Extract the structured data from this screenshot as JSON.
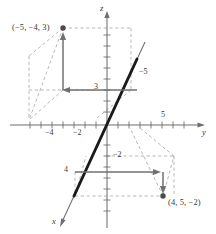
{
  "figure": {
    "axes": {
      "z_label": "z",
      "y_label": "y",
      "x_label": "x"
    },
    "points": [
      {
        "id": "p1",
        "label": "(−5, −4, 3)",
        "x": -5,
        "y": -4,
        "z": 3
      },
      {
        "id": "p2",
        "label": "(4, 5, −2)",
        "x": 4,
        "y": 5,
        "z": -2
      }
    ],
    "tick_labels": {
      "y_neg4": "−4",
      "y_neg2": "−2",
      "y_pos5": "5",
      "z_pos3": "3",
      "z_neg2": "−2",
      "x_neg5": "−5",
      "x_pos4": "4"
    },
    "colors": {
      "axis": "#6f6f6f",
      "guide_dashed": "#9a9a9a",
      "arrow_solid": "#707070",
      "heavy_line": "#1a1a1a",
      "point": "#4a4a4a",
      "text": "#3a3a3a"
    },
    "style": {
      "grid": false,
      "legend": false
    }
  }
}
